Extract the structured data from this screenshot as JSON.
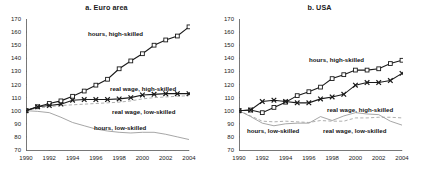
{
  "figure": {
    "panels": [
      {
        "id": "euro-area",
        "title": "a. Euro area",
        "annotations": [
          {
            "name": "hours-high-skilled",
            "text": "hours, high-skilled",
            "x": 62,
            "y": 11
          },
          {
            "name": "real-wage-high-skilled",
            "text": "real wage, high-skilled",
            "x": 84,
            "y": 66
          },
          {
            "name": "real-wage-low-skilled",
            "text": "real wage, low-skilled",
            "x": 86,
            "y": 89
          },
          {
            "name": "hours-low-skilled",
            "text": "hours, low-skilled",
            "x": 68,
            "y": 105
          }
        ]
      },
      {
        "id": "usa",
        "title": "b. USA",
        "annotations": [
          {
            "name": "hours-high-skilled",
            "text": "hours, high-skilled",
            "x": 70,
            "y": 37
          },
          {
            "name": "real-wage-high-skilled",
            "text": "real wage, high-skilled",
            "x": 88,
            "y": 87
          },
          {
            "name": "hours-low-skilled",
            "text": "hours, low-skilled",
            "x": 8,
            "y": 108
          },
          {
            "name": "real-wage-low-skilled",
            "text": "real wage, low-skilled",
            "x": 84,
            "y": 108
          }
        ]
      }
    ]
  },
  "chart_data": [
    {
      "type": "line",
      "title": "a. Euro area",
      "xlabel": "",
      "ylabel": "",
      "x": [
        1990,
        1991,
        1992,
        1993,
        1994,
        1995,
        1996,
        1997,
        1998,
        1999,
        2000,
        2001,
        2002,
        2003,
        2004
      ],
      "xlim": [
        1990,
        2004
      ],
      "ylim": [
        70,
        170
      ],
      "yticks": [
        70,
        80,
        90,
        100,
        110,
        120,
        130,
        140,
        150,
        160,
        170
      ],
      "xticks": [
        1990,
        1992,
        1994,
        1996,
        1998,
        2000,
        2002,
        2004
      ],
      "grid": false,
      "legend": "inline-annotations",
      "series": [
        {
          "name": "hours, high-skilled",
          "marker": "square",
          "style": "solid",
          "color": "#1a1a1a",
          "values": [
            100.0,
            103.0,
            105.5,
            107.5,
            111.0,
            115.0,
            119.5,
            124.0,
            132.0,
            138.0,
            143.5,
            150.0,
            154.0,
            157.0,
            164.0
          ]
        },
        {
          "name": "real wage, high-skilled",
          "marker": "x",
          "style": "solid",
          "color": "#1a1a1a",
          "values": [
            100.0,
            103.0,
            104.0,
            105.0,
            108.0,
            108.5,
            108.5,
            108.5,
            109.0,
            110.0,
            112.0,
            112.5,
            113.0,
            113.0,
            113.0
          ]
        },
        {
          "name": "real wage, low-skilled",
          "marker": "none",
          "style": "dashed",
          "color": "#9a9a9a",
          "values": [
            100.0,
            102.0,
            103.0,
            104.0,
            104.5,
            105.0,
            105.5,
            106.0,
            106.5,
            107.5,
            109.0,
            110.0,
            110.5,
            111.0,
            111.5
          ]
        },
        {
          "name": "hours, low-skilled",
          "marker": "none",
          "style": "solid",
          "color": "#8f8f8f",
          "values": [
            100.0,
            99.5,
            98.5,
            95.0,
            91.0,
            88.5,
            86.0,
            84.5,
            83.5,
            83.0,
            83.5,
            83.5,
            82.0,
            80.0,
            78.0
          ]
        }
      ]
    },
    {
      "type": "line",
      "title": "b. USA",
      "xlabel": "",
      "ylabel": "",
      "x": [
        1990,
        1991,
        1992,
        1993,
        1994,
        1995,
        1996,
        1997,
        1998,
        1999,
        2000,
        2001,
        2002,
        2003,
        2004
      ],
      "xlim": [
        1990,
        2004
      ],
      "ylim": [
        70,
        170
      ],
      "yticks": [
        70,
        80,
        90,
        100,
        110,
        120,
        130,
        140,
        150,
        160,
        170
      ],
      "xticks": [
        1990,
        1992,
        1994,
        1996,
        1998,
        2000,
        2002,
        2004
      ],
      "grid": false,
      "legend": "inline-annotations",
      "series": [
        {
          "name": "hours, high-skilled",
          "marker": "square",
          "style": "solid",
          "color": "#1a1a1a",
          "values": [
            100.0,
            100.5,
            98.5,
            102.5,
            106.5,
            111.5,
            114.5,
            118.0,
            124.5,
            127.5,
            131.0,
            131.0,
            132.0,
            136.0,
            138.5
          ]
        },
        {
          "name": "real wage, high-skilled",
          "marker": "x",
          "style": "solid",
          "color": "#1a1a1a",
          "values": [
            100.0,
            100.5,
            107.0,
            108.0,
            107.0,
            106.0,
            106.0,
            109.0,
            110.5,
            112.5,
            119.5,
            121.5,
            121.5,
            123.0,
            128.5
          ]
        },
        {
          "name": "real wage, low-skilled",
          "marker": "none",
          "style": "dashed",
          "color": "#9a9a9a",
          "values": [
            100.0,
            96.0,
            92.0,
            91.5,
            92.0,
            91.5,
            91.0,
            92.5,
            92.0,
            92.0,
            94.5,
            94.5,
            95.0,
            95.0,
            94.5
          ]
        },
        {
          "name": "hours, low-skilled",
          "marker": "none",
          "style": "solid",
          "color": "#8f8f8f",
          "values": [
            100.0,
            95.5,
            90.5,
            88.5,
            90.0,
            90.5,
            90.5,
            95.5,
            92.5,
            96.0,
            98.5,
            97.5,
            97.0,
            92.0,
            89.0
          ]
        }
      ]
    }
  ]
}
